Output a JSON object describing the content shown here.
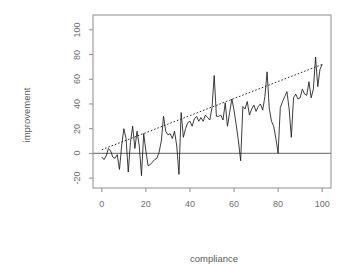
{
  "chart_data": {
    "type": "line",
    "title": "",
    "subtitle": "",
    "xlabel": "compliance",
    "ylabel": "improvement",
    "xlim": [
      -4,
      104
    ],
    "ylim": [
      -28,
      112
    ],
    "grid": false,
    "legend": null,
    "annotations": [],
    "xticks": [
      0,
      20,
      40,
      60,
      80,
      100
    ],
    "xtick_labels": [
      "0",
      "20",
      "40",
      "60",
      "80",
      "100"
    ],
    "yticks": [
      -20,
      0,
      20,
      40,
      60,
      80,
      100
    ],
    "ytick_labels": [
      "-20",
      "0",
      "20",
      "40",
      "60",
      "80",
      "100"
    ],
    "series": [
      {
        "name": "improvement",
        "kind": "line",
        "style": "solid",
        "color": "#1a1a1a",
        "x": [
          0,
          1,
          2,
          3,
          4,
          5,
          6,
          7,
          8,
          9,
          10,
          11,
          12,
          13,
          14,
          15,
          16,
          17,
          18,
          19,
          20,
          21,
          22,
          23,
          24,
          25,
          26,
          27,
          28,
          29,
          30,
          31,
          32,
          33,
          34,
          35,
          36,
          37,
          38,
          39,
          40,
          41,
          42,
          43,
          44,
          45,
          46,
          47,
          48,
          49,
          50,
          51,
          52,
          53,
          54,
          55,
          56,
          57,
          58,
          59,
          60,
          61,
          62,
          63,
          64,
          65,
          66,
          67,
          68,
          69,
          70,
          71,
          72,
          73,
          74,
          75,
          76,
          77,
          78,
          79,
          80,
          81,
          82,
          83,
          84,
          85,
          86,
          87,
          88,
          89,
          90,
          91,
          92,
          93,
          94,
          95,
          96,
          97,
          98,
          99,
          100
        ],
        "y": [
          -3,
          -5,
          -2,
          4,
          2,
          -3,
          -4,
          -1,
          -13,
          6,
          20,
          12,
          -15,
          9,
          22,
          4,
          18,
          6,
          -18,
          16,
          2,
          -10,
          -9,
          -7,
          -5,
          -4,
          1,
          10,
          30,
          18,
          15,
          16,
          12,
          18,
          6,
          -17,
          33,
          13,
          20,
          25,
          26,
          22,
          28,
          30,
          26,
          29,
          26,
          31,
          29,
          27,
          37,
          63,
          30,
          30,
          31,
          27,
          41,
          22,
          33,
          44,
          35,
          23,
          10,
          -6,
          38,
          36,
          42,
          31,
          36,
          39,
          34,
          38,
          40,
          35,
          46,
          66,
          36,
          26,
          22,
          12,
          0,
          37,
          42,
          46,
          50,
          36,
          13,
          45,
          48,
          44,
          45,
          52,
          48,
          47,
          58,
          45,
          52,
          78,
          54,
          68,
          72
        ]
      },
      {
        "name": "fitted-trend",
        "kind": "line",
        "style": "dotted",
        "color": "#2b2b2b",
        "x": [
          0,
          100
        ],
        "y": [
          3,
          72
        ]
      },
      {
        "name": "zero-reference",
        "kind": "hline",
        "style": "solid",
        "color": "#808080",
        "x": [
          -4,
          104
        ],
        "y": [
          0,
          0
        ]
      }
    ]
  },
  "axes": {
    "x_title": "compliance",
    "y_title": "improvement"
  }
}
